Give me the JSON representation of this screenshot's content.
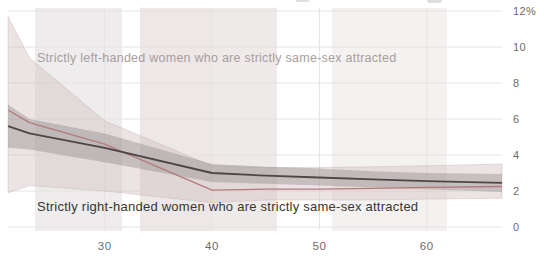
{
  "chart_data": {
    "type": "line",
    "title": "",
    "x_axis": {
      "label": "",
      "range": [
        21,
        67
      ],
      "ticks": [
        {
          "label": "30",
          "value": 30
        },
        {
          "label": "40",
          "value": 40
        },
        {
          "label": "50",
          "value": 50
        },
        {
          "label": "60",
          "value": 60
        }
      ]
    },
    "y_axis": {
      "label": "",
      "unit": "%",
      "range": [
        0,
        12
      ],
      "ticks": [
        {
          "label": "12%",
          "value": 12
        },
        {
          "label": "10",
          "value": 10
        },
        {
          "label": "8",
          "value": 8
        },
        {
          "label": "6",
          "value": 6
        },
        {
          "label": "4",
          "value": 4
        },
        {
          "label": "2",
          "value": 2
        },
        {
          "label": "0",
          "value": 0
        }
      ]
    },
    "grid": true,
    "legend_position": "annotations-inline",
    "grid_color": "#e5e2e2",
    "axis_text_color": "#6f6b6b",
    "series": [
      {
        "name": "strictly-left-handed-women-strictly-same-sex-attracted",
        "annotation": "Strictly left-handed women who are strictly same-sex attracted",
        "line_color": "#b5797c",
        "band_color": "rgba(210,191,191,0.42)",
        "band_stroke": "rgba(188,170,170,0.45)",
        "label_color": "#a89e9e",
        "x": [
          21,
          23,
          30,
          40,
          45,
          50,
          55,
          60,
          67
        ],
        "y": [
          6.5,
          5.8,
          4.6,
          2.05,
          2.1,
          2.1,
          2.15,
          2.2,
          2.25
        ],
        "ci_high": [
          11.7,
          9.4,
          5.9,
          3.4,
          3.3,
          3.3,
          3.35,
          3.4,
          3.5
        ],
        "ci_low": [
          1.9,
          2.3,
          2.0,
          1.35,
          1.5,
          1.5,
          1.5,
          1.55,
          1.6
        ]
      },
      {
        "name": "strictly-right-handed-women-strictly-same-sex-attracted",
        "annotation": "Strictly right-handed women who are strictly same-sex attracted",
        "line_color": "#4e4546",
        "band_color": "rgba(141,134,134,0.40)",
        "band_stroke": "none",
        "label_color": "#393535",
        "x": [
          21,
          23,
          30,
          40,
          45,
          50,
          55,
          60,
          67
        ],
        "y": [
          5.6,
          5.2,
          4.4,
          3.0,
          2.85,
          2.75,
          2.65,
          2.55,
          2.45
        ],
        "ci_high": [
          6.8,
          6.0,
          5.2,
          3.5,
          3.35,
          3.25,
          3.1,
          3.0,
          2.95
        ],
        "ci_low": [
          4.4,
          4.3,
          3.6,
          2.5,
          2.4,
          2.3,
          2.2,
          2.1,
          1.95
        ]
      }
    ],
    "background_stripes": [
      {
        "x": 35,
        "width": 87,
        "color": "rgba(199,191,191,0.30)"
      },
      {
        "x": 140,
        "width": 71,
        "color": "rgba(212,197,197,0.42)"
      },
      {
        "x": 211,
        "width": 66,
        "color": "rgba(214,200,200,0.38)"
      },
      {
        "x": 332,
        "width": 115,
        "color": "rgba(220,210,210,0.30)"
      }
    ]
  }
}
